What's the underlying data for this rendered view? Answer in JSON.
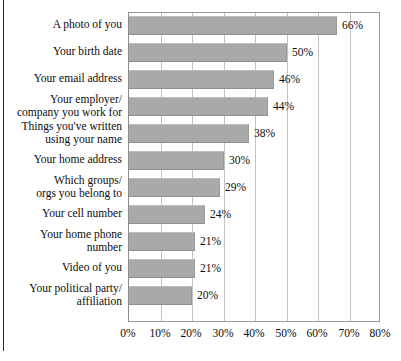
{
  "chart_data": {
    "type": "bar",
    "orientation": "horizontal",
    "title": "",
    "subtitle": "",
    "xlabel": "",
    "ylabel": "",
    "xlim": [
      0,
      80
    ],
    "grid": true,
    "legend": null,
    "value_suffix": "%",
    "categories": [
      "A photo of you",
      "Your birth date",
      "Your email address",
      "Your employer/\ncompany you work for",
      "Things you've written\nusing your name",
      "Your home address",
      "Which groups/\norgs you belong to",
      "Your cell number",
      "Your home phone\nnumber",
      "Video of you",
      "Your political party/\naffiliation"
    ],
    "values": [
      66,
      50,
      46,
      44,
      38,
      30,
      29,
      24,
      21,
      21,
      20
    ],
    "value_labels": [
      "66%",
      "50%",
      "46%",
      "44%",
      "38%",
      "30%",
      "29%",
      "24%",
      "21%",
      "21%",
      "20%"
    ],
    "xticks": [
      0,
      10,
      20,
      30,
      40,
      50,
      60,
      70,
      80
    ],
    "xtick_labels": [
      "0%",
      "10%",
      "20%",
      "30%",
      "40%",
      "50%",
      "60%",
      "70%",
      "80%"
    ],
    "colors": {
      "bar_fill": "#a9a9a9",
      "bar_edge": "#9a9a9a",
      "gridline": "#c2c2c2",
      "frame": "#9a9a9a",
      "text": "#0d0d0d",
      "background": "#ffffff",
      "page_edge": "#2a2a2a"
    }
  }
}
